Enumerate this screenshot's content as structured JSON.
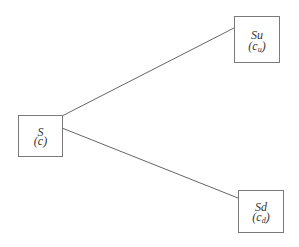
{
  "diagram": {
    "type": "binomial-tree",
    "nodes": {
      "root": {
        "id": "S",
        "label": "S",
        "value_prefix": "(c",
        "value_sub": "",
        "value_suffix": ")"
      },
      "up": {
        "id": "Su",
        "label": "Su",
        "value_prefix": "(c",
        "value_sub": "u",
        "value_suffix": ")"
      },
      "down": {
        "id": "Sd",
        "label": "Sd",
        "value_prefix": "(c",
        "value_sub": "d",
        "value_suffix": ")"
      }
    },
    "edges": [
      {
        "from": "S",
        "to": "Su"
      },
      {
        "from": "S",
        "to": "Sd"
      }
    ],
    "colors": {
      "line": "#666666",
      "border": "#7a7a7a",
      "text": "#333333",
      "background": "#ffffff"
    }
  }
}
